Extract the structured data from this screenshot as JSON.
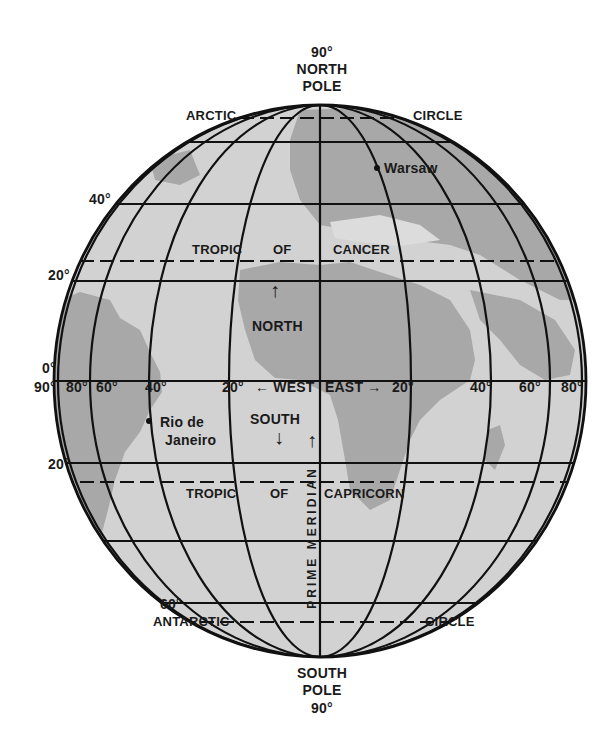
{
  "colors": {
    "ocean": "#d4d4d4",
    "land": "#a9a9a9",
    "light_land": "#e6e6e6",
    "lines": "#111111",
    "text": "#1a1a1a",
    "background": "#ffffff"
  },
  "poles": {
    "north": {
      "degree": "90°",
      "line1": "NORTH",
      "line2": "POLE"
    },
    "south": {
      "degree": "90°",
      "line1": "SOUTH",
      "line2": "POLE"
    }
  },
  "circles": {
    "arctic": {
      "left": "ARCTIC",
      "right": "CIRCLE"
    },
    "antarctic": {
      "left": "ANTARCTIC",
      "right": "CIRCLE"
    },
    "cancer": {
      "word1": "TROPIC",
      "word2": "OF",
      "word3": "CANCER"
    },
    "capricorn": {
      "word1": "TROPIC",
      "word2": "OF",
      "word3": "CAPRICORN"
    }
  },
  "latitude_labels": {
    "n40": "40°",
    "n20": "20°",
    "equator": "0°",
    "s20": "20°",
    "s60": "60°"
  },
  "longitude_labels": {
    "w90": "90°",
    "w80": "80°",
    "w60": "60°",
    "w40": "40°",
    "w20": "20°",
    "e20": "20°",
    "e40": "40°",
    "e60": "60°",
    "e80": "80°"
  },
  "directions": {
    "west": "← WEST",
    "east": "EAST →",
    "north": "NORTH",
    "south": "SOUTH",
    "north_arrow": "↑",
    "south_arrow": "↓"
  },
  "prime_meridian": "PRIME MERIDIAN",
  "cities": [
    {
      "name": "Warsaw"
    },
    {
      "name_line1": "Rio de",
      "name_line2": "Janeiro"
    }
  ]
}
